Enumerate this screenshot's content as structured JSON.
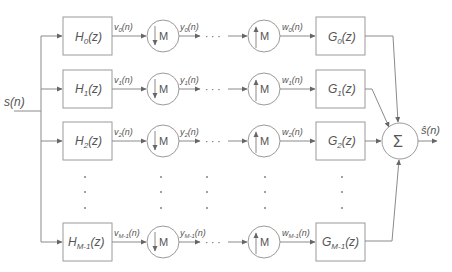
{
  "diagram": {
    "type": "block-diagram",
    "input": {
      "label": "s",
      "arg": "(n)"
    },
    "output": {
      "label": "ŝ",
      "arg": "(n)"
    },
    "sum_symbol": "Σ",
    "decimator_label": "M",
    "expander_label": "M",
    "ellipsis": "· · ·",
    "branches": [
      {
        "index": "0",
        "H": "H",
        "G": "G",
        "v": "v",
        "y": "y",
        "w": "w",
        "sub": "0"
      },
      {
        "index": "1",
        "H": "H",
        "G": "G",
        "v": "v",
        "y": "y",
        "w": "w",
        "sub": "1"
      },
      {
        "index": "2",
        "H": "H",
        "G": "G",
        "v": "v",
        "y": "y",
        "w": "w",
        "sub": "2"
      },
      {
        "index": "M-1",
        "H": "H",
        "G": "G",
        "v": "v",
        "y": "y",
        "w": "w",
        "sub": "M-1"
      }
    ],
    "filter_arg": "(z)",
    "signal_arg": "(n)",
    "colors": {
      "line": "#8a8a8a",
      "text": "#555555",
      "background": "#ffffff"
    }
  }
}
